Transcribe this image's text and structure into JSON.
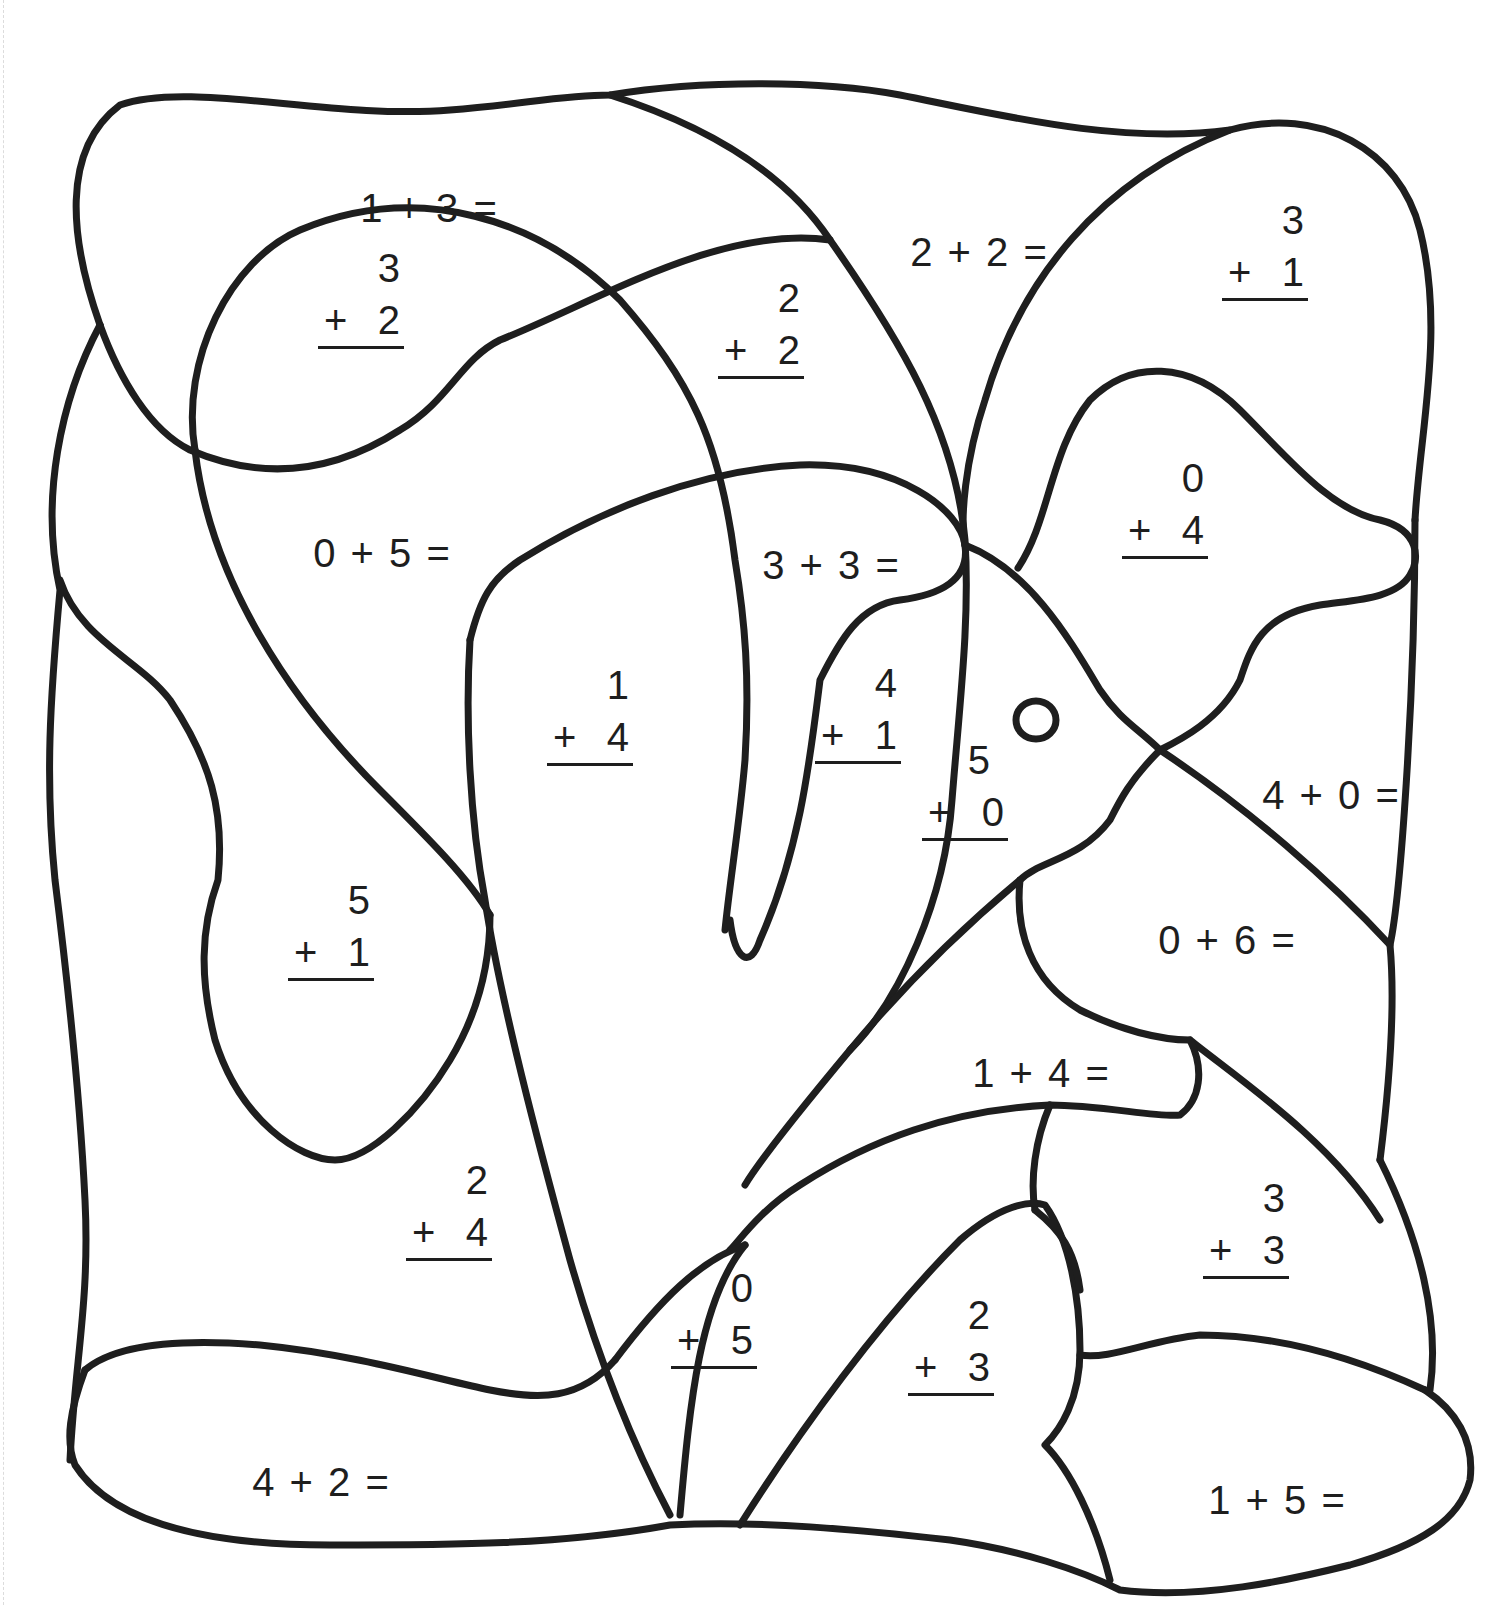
{
  "worksheet": {
    "type": "addition color-by-number",
    "problems": [
      {
        "id": "p1",
        "format": "horizontal",
        "text": "1 + 3 =",
        "a": 1,
        "b": 3
      },
      {
        "id": "p2",
        "format": "vertical",
        "top": "3",
        "bottom": "2",
        "op": "+",
        "a": 3,
        "b": 2
      },
      {
        "id": "p3",
        "format": "horizontal",
        "text": "2 + 2 =",
        "a": 2,
        "b": 2
      },
      {
        "id": "p4",
        "format": "vertical",
        "top": "2",
        "bottom": "2",
        "op": "+",
        "a": 2,
        "b": 2
      },
      {
        "id": "p5",
        "format": "vertical",
        "top": "3",
        "bottom": "1",
        "op": "+",
        "a": 3,
        "b": 1
      },
      {
        "id": "p6",
        "format": "horizontal",
        "text": "0 + 5 =",
        "a": 0,
        "b": 5
      },
      {
        "id": "p7",
        "format": "horizontal",
        "text": "3 + 3 =",
        "a": 3,
        "b": 3
      },
      {
        "id": "p8",
        "format": "vertical",
        "top": "0",
        "bottom": "4",
        "op": "+",
        "a": 0,
        "b": 4
      },
      {
        "id": "p9",
        "format": "vertical",
        "top": "1",
        "bottom": "4",
        "op": "+",
        "a": 1,
        "b": 4
      },
      {
        "id": "p10",
        "format": "vertical",
        "top": "4",
        "bottom": "1",
        "op": "+",
        "a": 4,
        "b": 1
      },
      {
        "id": "p11",
        "format": "vertical",
        "top": "5",
        "bottom": "0",
        "op": "+",
        "a": 5,
        "b": 0
      },
      {
        "id": "p12",
        "format": "horizontal",
        "text": "4 + 0 =",
        "a": 4,
        "b": 0
      },
      {
        "id": "p13",
        "format": "vertical",
        "top": "5",
        "bottom": "1",
        "op": "+",
        "a": 5,
        "b": 1
      },
      {
        "id": "p14",
        "format": "horizontal",
        "text": "0 + 6 =",
        "a": 0,
        "b": 6
      },
      {
        "id": "p15",
        "format": "horizontal",
        "text": "1 + 4 =",
        "a": 1,
        "b": 4
      },
      {
        "id": "p16",
        "format": "vertical",
        "top": "2",
        "bottom": "4",
        "op": "+",
        "a": 2,
        "b": 4
      },
      {
        "id": "p17",
        "format": "vertical",
        "top": "3",
        "bottom": "3",
        "op": "+",
        "a": 3,
        "b": 3
      },
      {
        "id": "p18",
        "format": "vertical",
        "top": "0",
        "bottom": "5",
        "op": "+",
        "a": 0,
        "b": 5
      },
      {
        "id": "p19",
        "format": "vertical",
        "top": "2",
        "bottom": "3",
        "op": "+",
        "a": 2,
        "b": 3
      },
      {
        "id": "p20",
        "format": "horizontal",
        "text": "4 + 2 =",
        "a": 4,
        "b": 2
      },
      {
        "id": "p21",
        "format": "horizontal",
        "text": "1 + 5 =",
        "a": 1,
        "b": 5
      }
    ],
    "colors": {
      "ink": "#1e1e1e",
      "paper": "#ffffff"
    }
  }
}
